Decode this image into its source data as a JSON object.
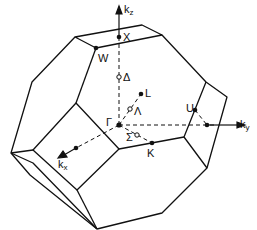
{
  "diagram": {
    "type": "Brillouin zone (truncated octahedron, fcc)",
    "axes": [
      {
        "id": "kz",
        "label": "k",
        "sub": "z"
      },
      {
        "id": "ky",
        "label": "k",
        "sub": "y"
      },
      {
        "id": "kx",
        "label": "k",
        "sub": "x"
      }
    ],
    "points": [
      {
        "id": "gamma",
        "label": "Γ"
      },
      {
        "id": "X",
        "label": "X"
      },
      {
        "id": "W",
        "label": "W"
      },
      {
        "id": "L",
        "label": "L"
      },
      {
        "id": "U",
        "label": "U"
      },
      {
        "id": "K",
        "label": "K"
      },
      {
        "id": "delta",
        "label": "Δ"
      },
      {
        "id": "lambda",
        "label": "Λ"
      },
      {
        "id": "sigma",
        "label": "Σ"
      }
    ],
    "colors": {
      "line": "#111111",
      "background": "#ffffff"
    }
  }
}
